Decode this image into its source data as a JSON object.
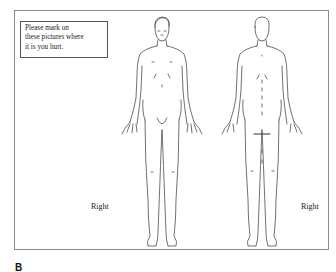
{
  "instruction": {
    "line1": "Please mark on",
    "line2": "these pictures where",
    "line3": "it is you hurt."
  },
  "front_figure": {
    "side_label": "Right"
  },
  "back_figure": {
    "side_label": "Right"
  },
  "panel_label": "B"
}
